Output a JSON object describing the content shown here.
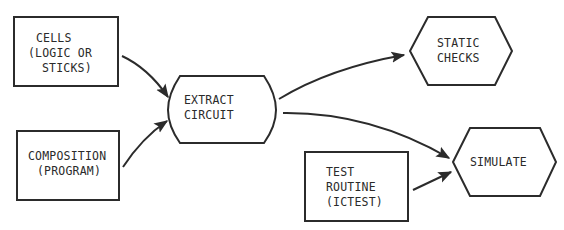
{
  "diagram": {
    "type": "flowchart",
    "nodes": {
      "cells": {
        "shape": "rectangle",
        "lines": [
          "CELLS",
          "(LOGIC OR",
          "STICKS)"
        ]
      },
      "composition": {
        "shape": "rectangle",
        "lines": [
          "COMPOSITION",
          "(PROGRAM)"
        ]
      },
      "extract": {
        "shape": "rounded-bulge",
        "lines": [
          "EXTRACT",
          "CIRCUIT"
        ]
      },
      "static_checks": {
        "shape": "hexagon",
        "lines": [
          "STATIC",
          "CHECKS"
        ]
      },
      "test_routine": {
        "shape": "rectangle",
        "lines": [
          "TEST",
          "ROUTINE",
          "(ICTEST)"
        ]
      },
      "simulate": {
        "shape": "hexagon",
        "lines": [
          "SIMULATE"
        ]
      }
    },
    "edges": [
      {
        "from": "CELLS",
        "to": "EXTRACT CIRCUIT"
      },
      {
        "from": "COMPOSITION",
        "to": "EXTRACT CIRCUIT"
      },
      {
        "from": "EXTRACT CIRCUIT",
        "to": "STATIC CHECKS"
      },
      {
        "from": "EXTRACT CIRCUIT",
        "to": "SIMULATE"
      },
      {
        "from": "TEST ROUTINE",
        "to": "SIMULATE"
      }
    ],
    "colors": {
      "stroke": "#2b2b2b",
      "text": "#2a2a2a",
      "background": "#ffffff"
    }
  }
}
